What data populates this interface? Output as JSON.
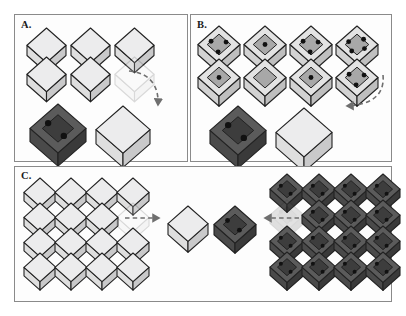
{
  "figure": {
    "type": "diagram",
    "background_color": "#ffffff",
    "panel_border_color": "#8a8a8a"
  },
  "colors": {
    "closed_box_top": "#ececed",
    "closed_box_left": "#dedede",
    "closed_box_right": "#c9c9ca",
    "open_box_light_rim": "#e3e3e3",
    "open_box_light_inner": "#a8a8a8",
    "open_box_dark_rim": "#5b5b5b",
    "open_box_dark_inner": "#3d3d3d",
    "dot": "#111111",
    "outline": "#222222",
    "arrow": "#6f6f6f"
  },
  "panels": [
    {
      "id": "panel-a",
      "label": "A.",
      "description": "Two rows of three closed light boxes; last one faded. Bottom row: dark open box with two dots and a closed light box. Dashed arrow curves from the bottom closed box up to the faded slot.",
      "grid": {
        "rows": 2,
        "cols": 3,
        "box_type": "closed-light",
        "ghost_index": 5
      },
      "bottom_items": [
        {
          "name": "dark-open-box",
          "type": "open-dark",
          "dots": 2
        },
        {
          "name": "light-closed-box",
          "type": "closed-light",
          "dots": 0
        }
      ],
      "arrow": {
        "name": "arrow-a",
        "style": "dashed-curved",
        "direction": "up-right-to-slot"
      }
    },
    {
      "id": "panel-b",
      "label": "B.",
      "description": "Two rows of four open light boxes containing dots; bottom row holds a dark open box with two dots and a closed light box, with a dashed arrow pointing left.",
      "grid": {
        "rows": 2,
        "cols": 4,
        "box_type": "open-light",
        "dot_counts": [
          [
            3,
            1,
            3,
            4
          ],
          [
            1,
            0,
            1,
            3
          ]
        ]
      },
      "bottom_items": [
        {
          "name": "dark-open-box",
          "type": "open-dark",
          "dots": 2
        },
        {
          "name": "light-closed-box",
          "type": "closed-light",
          "dots": 0
        }
      ],
      "arrow": {
        "name": "arrow-b",
        "style": "dashed-curved",
        "direction": "left"
      }
    },
    {
      "id": "panel-c",
      "label": "C.",
      "description": "Left 4x4 array of closed light boxes with one faded slot; center a closed light box and a dark open box with two dots; right 4x4 array of dark open boxes each with two dots and one faded slot. Dashed arrows point inward toward the centre pair.",
      "left_grid": {
        "rows": 4,
        "cols": 4,
        "box_type": "closed-light",
        "ghost_index": 7
      },
      "center_items": [
        {
          "name": "light-closed-box",
          "type": "closed-light",
          "dots": 0
        },
        {
          "name": "dark-open-box",
          "type": "open-dark",
          "dots": 2
        }
      ],
      "right_grid": {
        "rows": 4,
        "cols": 4,
        "box_type": "open-dark",
        "dots_per_box": 2,
        "ghost_index": 4
      },
      "arrows": [
        {
          "name": "arrow-c-left",
          "style": "dashed-straight",
          "direction": "right"
        },
        {
          "name": "arrow-c-right",
          "style": "dashed-straight",
          "direction": "left"
        }
      ]
    }
  ]
}
